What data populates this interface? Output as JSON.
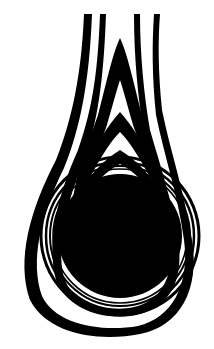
{
  "figure": {
    "colors": {
      "background": "#ffffff",
      "ink": "#000000"
    }
  }
}
